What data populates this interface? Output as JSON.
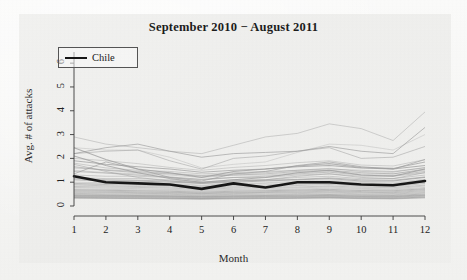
{
  "chart_data": {
    "type": "line",
    "title": "September 2010 − August 2011",
    "xlabel": "Month",
    "ylabel": "Avg. # of attacks",
    "xlim": [
      1,
      12
    ],
    "ylim": [
      0,
      6.3
    ],
    "x": [
      1,
      2,
      3,
      4,
      5,
      6,
      7,
      8,
      9,
      10,
      11,
      12
    ],
    "xticks": [
      "1",
      "2",
      "3",
      "4",
      "5",
      "6",
      "7",
      "8",
      "9",
      "10",
      "11",
      "12"
    ],
    "yticks": [
      "0",
      "1",
      "2",
      "3",
      "4",
      "5",
      "6"
    ],
    "grid": false,
    "legend": {
      "position": "top-left",
      "entries": [
        {
          "label": "Chile",
          "color": "#171717",
          "width": 2.6
        }
      ]
    },
    "highlight_series": {
      "name": "Chile",
      "color": "#171717",
      "values": [
        1.25,
        1.0,
        0.95,
        0.9,
        0.72,
        0.95,
        0.78,
        1.0,
        1.0,
        0.9,
        0.87,
        1.05
      ]
    },
    "background_series_color": "#9a9a9a",
    "background_series_count": 38,
    "series": [
      {
        "name": "country-01",
        "values": [
          2.45,
          2.35,
          2.35,
          2.05,
          1.6,
          1.75,
          1.85,
          2.25,
          2.6,
          2.55,
          2.35,
          3.0
        ]
      },
      {
        "name": "country-02",
        "values": [
          2.2,
          2.3,
          2.35,
          1.9,
          1.55,
          2.0,
          2.1,
          2.3,
          2.45,
          2.0,
          2.05,
          2.5
        ]
      },
      {
        "name": "country-03",
        "values": [
          2.45,
          1.95,
          1.55,
          1.4,
          1.2,
          1.45,
          1.55,
          1.65,
          1.7,
          1.6,
          1.55,
          1.7
        ]
      },
      {
        "name": "country-04",
        "values": [
          1.8,
          1.6,
          1.5,
          1.45,
          1.35,
          1.4,
          1.45,
          1.5,
          1.55,
          1.5,
          1.45,
          1.6
        ]
      },
      {
        "name": "country-05",
        "values": [
          1.35,
          1.85,
          1.55,
          1.2,
          1.05,
          1.35,
          1.45,
          1.7,
          1.85,
          1.65,
          1.55,
          1.95
        ]
      },
      {
        "name": "country-06",
        "values": [
          1.5,
          1.4,
          1.35,
          1.3,
          1.2,
          1.3,
          1.3,
          1.4,
          1.45,
          1.35,
          1.35,
          1.5
        ]
      },
      {
        "name": "country-07",
        "values": [
          1.65,
          1.5,
          1.4,
          1.35,
          1.25,
          1.3,
          1.35,
          1.45,
          1.5,
          1.4,
          1.35,
          1.55
        ]
      },
      {
        "name": "country-08",
        "values": [
          1.3,
          1.25,
          1.25,
          1.2,
          1.1,
          1.2,
          1.2,
          1.3,
          1.35,
          1.25,
          1.25,
          1.4
        ]
      },
      {
        "name": "country-09",
        "values": [
          1.2,
          1.15,
          1.15,
          1.1,
          1.0,
          1.1,
          1.1,
          1.2,
          1.25,
          1.15,
          1.15,
          1.3
        ]
      },
      {
        "name": "country-10",
        "values": [
          1.1,
          1.05,
          1.05,
          1.0,
          0.95,
          1.0,
          1.05,
          1.1,
          1.15,
          1.05,
          1.05,
          1.2
        ]
      },
      {
        "name": "country-11",
        "values": [
          1.0,
          0.98,
          0.95,
          0.92,
          0.85,
          0.92,
          0.95,
          1.0,
          1.05,
          0.98,
          0.95,
          1.1
        ]
      },
      {
        "name": "country-12",
        "values": [
          0.95,
          0.9,
          0.88,
          0.85,
          0.8,
          0.85,
          0.88,
          0.92,
          0.95,
          0.9,
          0.88,
          1.0
        ]
      },
      {
        "name": "country-13",
        "values": [
          0.88,
          0.85,
          0.82,
          0.8,
          0.75,
          0.8,
          0.82,
          0.86,
          0.9,
          0.84,
          0.82,
          0.95
        ]
      },
      {
        "name": "country-14",
        "values": [
          0.82,
          0.8,
          0.78,
          0.75,
          0.7,
          0.75,
          0.78,
          0.8,
          0.84,
          0.79,
          0.77,
          0.88
        ]
      },
      {
        "name": "country-15",
        "values": [
          0.78,
          0.75,
          0.73,
          0.7,
          0.66,
          0.7,
          0.73,
          0.76,
          0.8,
          0.74,
          0.72,
          0.84
        ]
      },
      {
        "name": "country-16",
        "values": [
          0.72,
          0.7,
          0.68,
          0.66,
          0.62,
          0.66,
          0.68,
          0.71,
          0.75,
          0.7,
          0.68,
          0.78
        ]
      },
      {
        "name": "country-17",
        "values": [
          0.68,
          0.66,
          0.64,
          0.62,
          0.58,
          0.62,
          0.64,
          0.67,
          0.7,
          0.65,
          0.64,
          0.73
        ]
      },
      {
        "name": "country-18",
        "values": [
          0.64,
          0.62,
          0.6,
          0.58,
          0.55,
          0.58,
          0.6,
          0.63,
          0.66,
          0.61,
          0.6,
          0.69
        ]
      },
      {
        "name": "country-19",
        "values": [
          0.6,
          0.58,
          0.56,
          0.55,
          0.52,
          0.55,
          0.57,
          0.59,
          0.62,
          0.58,
          0.56,
          0.65
        ]
      },
      {
        "name": "country-20",
        "values": [
          0.56,
          0.55,
          0.53,
          0.52,
          0.49,
          0.52,
          0.54,
          0.56,
          0.58,
          0.55,
          0.53,
          0.61
        ]
      },
      {
        "name": "country-21",
        "values": [
          0.53,
          0.51,
          0.5,
          0.49,
          0.46,
          0.49,
          0.5,
          0.52,
          0.55,
          0.51,
          0.5,
          0.57
        ]
      },
      {
        "name": "country-22",
        "values": [
          0.5,
          0.48,
          0.47,
          0.46,
          0.43,
          0.46,
          0.47,
          0.49,
          0.51,
          0.48,
          0.47,
          0.54
        ]
      },
      {
        "name": "country-23",
        "values": [
          0.47,
          0.45,
          0.44,
          0.43,
          0.41,
          0.43,
          0.44,
          0.46,
          0.48,
          0.45,
          0.44,
          0.5
        ]
      },
      {
        "name": "country-24",
        "values": [
          0.44,
          0.43,
          0.42,
          0.41,
          0.39,
          0.41,
          0.42,
          0.43,
          0.45,
          0.42,
          0.41,
          0.47
        ]
      },
      {
        "name": "country-25",
        "values": [
          0.42,
          0.41,
          0.4,
          0.39,
          0.37,
          0.39,
          0.4,
          0.41,
          0.43,
          0.4,
          0.39,
          0.45
        ]
      },
      {
        "name": "country-26",
        "values": [
          0.4,
          0.39,
          0.38,
          0.37,
          0.35,
          0.37,
          0.38,
          0.39,
          0.41,
          0.38,
          0.37,
          0.43
        ]
      },
      {
        "name": "country-27",
        "values": [
          0.38,
          0.37,
          0.36,
          0.35,
          0.33,
          0.35,
          0.36,
          0.37,
          0.39,
          0.36,
          0.35,
          0.41
        ]
      },
      {
        "name": "country-28",
        "values": [
          0.36,
          0.35,
          0.34,
          0.33,
          0.31,
          0.33,
          0.34,
          0.35,
          0.37,
          0.34,
          0.33,
          0.38
        ]
      },
      {
        "name": "country-29",
        "values": [
          0.34,
          0.33,
          0.32,
          0.31,
          0.3,
          0.31,
          0.32,
          0.33,
          0.35,
          0.32,
          0.31,
          0.36
        ]
      },
      {
        "name": "country-30",
        "values": [
          0.33,
          0.32,
          0.31,
          0.3,
          0.29,
          0.3,
          0.31,
          0.32,
          0.33,
          0.31,
          0.3,
          0.34
        ]
      },
      {
        "name": "country-31",
        "values": [
          1.45,
          1.38,
          1.3,
          1.22,
          1.12,
          1.2,
          1.25,
          1.35,
          1.42,
          1.3,
          1.28,
          1.45
        ]
      },
      {
        "name": "country-32",
        "values": [
          1.6,
          1.52,
          1.45,
          1.38,
          1.28,
          1.35,
          1.4,
          1.5,
          1.58,
          1.45,
          1.42,
          1.62
        ]
      },
      {
        "name": "country-33",
        "values": [
          1.9,
          1.75,
          1.65,
          1.55,
          1.42,
          1.5,
          1.55,
          1.68,
          1.78,
          1.62,
          1.58,
          1.85
        ]
      },
      {
        "name": "country-34",
        "values": [
          2.0,
          1.9,
          1.78,
          1.62,
          1.5,
          1.62,
          1.7,
          1.82,
          1.9,
          1.72,
          1.68,
          1.95
        ]
      },
      {
        "name": "country-35",
        "values": [
          1.15,
          1.1,
          1.08,
          1.05,
          0.98,
          1.05,
          1.08,
          1.12,
          1.18,
          1.1,
          1.08,
          1.22
        ]
      },
      {
        "name": "country-36",
        "values": [
          0.9,
          0.95,
          1.0,
          0.95,
          0.88,
          0.95,
          0.98,
          1.05,
          1.1,
          1.02,
          1.0,
          1.12
        ]
      },
      {
        "name": "country-37",
        "values": [
          1.75,
          1.45,
          1.2,
          1.05,
          0.95,
          1.05,
          1.1,
          1.25,
          1.35,
          1.2,
          1.15,
          1.4
        ]
      },
      {
        "name": "country-38",
        "values": [
          2.1,
          1.7,
          1.4,
          1.15,
          1.0,
          1.1,
          1.2,
          1.4,
          1.5,
          1.3,
          1.25,
          1.55
        ]
      },
      {
        "name": "outlier-top",
        "values": [
          2.9,
          2.6,
          2.45,
          2.3,
          2.2,
          2.55,
          2.9,
          3.05,
          3.45,
          3.25,
          2.75,
          3.95
        ]
      },
      {
        "name": "outlier-mid",
        "values": [
          2.2,
          2.45,
          2.6,
          2.3,
          2.05,
          2.2,
          2.25,
          2.3,
          2.5,
          2.3,
          2.2,
          3.3
        ]
      }
    ]
  }
}
